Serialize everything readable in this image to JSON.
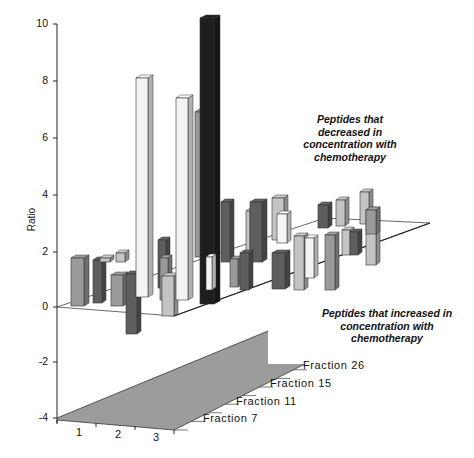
{
  "chart_data": {
    "type": "bar",
    "subtype": "3d-bar",
    "title": "",
    "ylabel": "Ratio",
    "xlabel": "",
    "ylim": [
      -4,
      10
    ],
    "yticks": [
      "10",
      "8",
      "6",
      "4",
      "2",
      "0",
      "-2",
      "-4"
    ],
    "x_categories": [
      "1",
      "2",
      "3"
    ],
    "z_categories": [
      "Fraction 7",
      "Fraction 11",
      "Fraction 15",
      "Fraction 26"
    ],
    "grid": false,
    "legend": null,
    "annotations": [
      "Peptides that decreased in concentration with chemotherapy",
      "Peptides that increased in concentration with chemotherapy"
    ],
    "series": [
      {
        "name": "Fraction 7",
        "values": [
          1.7,
          1.1,
          -0.9,
          1.8,
          1.4,
          0.5,
          1.6
        ]
      },
      {
        "name": "Fraction 11",
        "values": [
          1.6,
          1.7,
          8.1,
          7.4,
          1.7,
          2.1,
          3.2
        ]
      },
      {
        "name": "Fraction 15",
        "values": [
          1.8,
          1.9,
          9.3,
          3.0,
          2.8,
          2.4,
          1.9
        ]
      },
      {
        "name": "Fraction 26",
        "values": [
          1.3,
          2.2,
          1.5,
          2.9,
          3.1,
          2.6,
          2.3
        ]
      }
    ]
  },
  "labels": {
    "ylabel": "Ratio",
    "yticks": [
      {
        "text": "10",
        "y": 24
      },
      {
        "text": "8",
        "y": 81
      },
      {
        "text": "6",
        "y": 138
      },
      {
        "text": "4",
        "y": 195
      },
      {
        "text": "2",
        "y": 252
      },
      {
        "text": "0",
        "y": 307
      },
      {
        "text": "-2",
        "y": 362
      },
      {
        "text": "-4",
        "y": 418
      }
    ],
    "xcats": [
      {
        "text": "1",
        "x": 76,
        "y": 426
      },
      {
        "text": "2",
        "x": 115,
        "y": 428
      },
      {
        "text": "3",
        "x": 153,
        "y": 431
      }
    ],
    "zcats": [
      {
        "text": "Fraction 7",
        "x": 203,
        "y": 412
      },
      {
        "text": "Fraction 11",
        "x": 236,
        "y": 395
      },
      {
        "text": "Fraction 15",
        "x": 270,
        "y": 377
      },
      {
        "text": "Fraction 26",
        "x": 303,
        "y": 359
      }
    ],
    "annot_top": [
      "Peptides that",
      "decreased in",
      "concentration with",
      "chemotherapy"
    ],
    "annot_bottom": [
      "Peptides that increased in",
      "concentration with",
      "chemotherapy"
    ]
  },
  "colors": {
    "white": "#f4f4f4",
    "light": "#c4c4c4",
    "mid": "#9a9a9a",
    "dark": "#5e5e5e",
    "black": "#1e1e1e",
    "floor": "#9c9c9c"
  },
  "bars": [
    {
      "x": 71,
      "top": 258,
      "bottom": 306,
      "w": 18,
      "c": "mid"
    },
    {
      "x": 93,
      "top": 260,
      "bottom": 303,
      "w": 13,
      "c": "dark"
    },
    {
      "x": 100,
      "top": 258,
      "bottom": 262,
      "w": 14,
      "c": "light"
    },
    {
      "x": 116,
      "top": 253,
      "bottom": 262,
      "w": 13,
      "c": "light"
    },
    {
      "x": 111,
      "top": 275,
      "bottom": 306,
      "w": 17,
      "c": "mid"
    },
    {
      "x": 126,
      "top": 274,
      "bottom": 334,
      "w": 15,
      "c": "dark"
    },
    {
      "x": 136,
      "top": 78,
      "bottom": 297,
      "w": 17,
      "c": "white"
    },
    {
      "x": 158,
      "top": 240,
      "bottom": 288,
      "w": 12,
      "c": "dark"
    },
    {
      "x": 160,
      "top": 258,
      "bottom": 300,
      "w": 12,
      "c": "mid"
    },
    {
      "x": 162,
      "top": 276,
      "bottom": 316,
      "w": 16,
      "c": "light"
    },
    {
      "x": 176,
      "top": 98,
      "bottom": 300,
      "w": 17,
      "c": "white"
    },
    {
      "x": 195,
      "top": 112,
      "bottom": 257,
      "w": 10,
      "c": "mid"
    },
    {
      "x": 200,
      "top": 18,
      "bottom": 304,
      "w": 20,
      "c": "black"
    },
    {
      "x": 206,
      "top": 257,
      "bottom": 290,
      "w": 10,
      "c": "white"
    },
    {
      "x": 221,
      "top": 202,
      "bottom": 262,
      "w": 13,
      "c": "dark"
    },
    {
      "x": 230,
      "top": 259,
      "bottom": 287,
      "w": 12,
      "c": "mid"
    },
    {
      "x": 246,
      "top": 211,
      "bottom": 255,
      "w": 8,
      "c": "light"
    },
    {
      "x": 250,
      "top": 202,
      "bottom": 262,
      "w": 17,
      "c": "dark"
    },
    {
      "x": 240,
      "top": 253,
      "bottom": 290,
      "w": 13,
      "c": "dark"
    },
    {
      "x": 272,
      "top": 198,
      "bottom": 240,
      "w": 16,
      "c": "light"
    },
    {
      "x": 277,
      "top": 214,
      "bottom": 243,
      "w": 14,
      "c": "white"
    },
    {
      "x": 272,
      "top": 253,
      "bottom": 289,
      "w": 18,
      "c": "dark"
    },
    {
      "x": 294,
      "top": 236,
      "bottom": 290,
      "w": 14,
      "c": "light"
    },
    {
      "x": 305,
      "top": 238,
      "bottom": 278,
      "w": 13,
      "c": "white"
    },
    {
      "x": 318,
      "top": 205,
      "bottom": 228,
      "w": 14,
      "c": "dark"
    },
    {
      "x": 336,
      "top": 200,
      "bottom": 226,
      "w": 13,
      "c": "light"
    },
    {
      "x": 325,
      "top": 235,
      "bottom": 290,
      "w": 14,
      "c": "mid"
    },
    {
      "x": 342,
      "top": 230,
      "bottom": 255,
      "w": 12,
      "c": "light"
    },
    {
      "x": 350,
      "top": 232,
      "bottom": 255,
      "w": 12,
      "c": "dark"
    },
    {
      "x": 360,
      "top": 192,
      "bottom": 224,
      "w": 13,
      "c": "light"
    },
    {
      "x": 366,
      "top": 210,
      "bottom": 265,
      "w": 14,
      "c": "light"
    },
    {
      "x": 366,
      "top": 210,
      "bottom": 234,
      "w": 14,
      "c": "mid"
    }
  ]
}
